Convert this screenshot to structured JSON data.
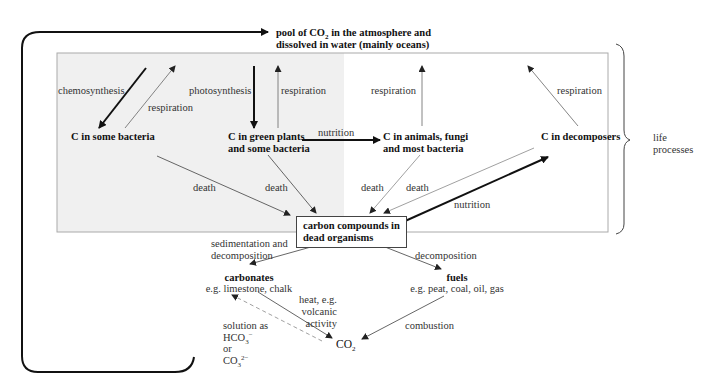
{
  "pool": {
    "line1": "pool of CO",
    "sub": "2",
    "line1_rest": " in the atmosphere and",
    "line2": "dissolved in water (mainly oceans)"
  },
  "nodes": {
    "some_bacteria": "C in some bacteria",
    "green_plants_1": "C in green plants",
    "green_plants_2": "and some bacteria",
    "animals_1": "C in animals, fungi",
    "animals_2": "and most bacteria",
    "decomposers": "C in decomposers",
    "dead_1": "carbon compounds in",
    "dead_2": "dead organisms",
    "carbonates_title": "carbonates",
    "carbonates_eg": "e.g. limestone, chalk",
    "fuels_title": "fuels",
    "fuels_eg": "e.g. peat, coal, oil, gas",
    "co2": "CO",
    "co2_sub": "2"
  },
  "labels": {
    "chemosynthesis": "chemosynthesis",
    "respiration_bacteria": "respiration",
    "photosynthesis": "photosynthesis",
    "respiration_plants": "respiration",
    "respiration_animals": "respiration",
    "respiration_decomposers": "respiration",
    "nutrition_plants_animals": "nutrition",
    "death_bacteria": "death",
    "death_plants": "death",
    "death_animals": "death",
    "death_decomposers": "death",
    "nutrition_decomposers": "nutrition",
    "sedimentation_1": "sedimentation and",
    "sedimentation_2": "decomposition",
    "decomposition": "decomposition",
    "heat_1": "heat, e.g.",
    "heat_2": "volcanic",
    "heat_3": "activity",
    "combustion": "combustion",
    "solution_1": "solution as",
    "solution_hco3": "HCO",
    "solution_hco3_sub": "3",
    "solution_hco3_sup": "−",
    "solution_or": "or",
    "solution_co3": "CO",
    "solution_co3_sub": "3",
    "solution_co3_sup": "2−",
    "life_1": "life",
    "life_2": "processes"
  },
  "colors": {
    "shaded_region": "#f0f0f0",
    "box_border": "#999999",
    "thick_arrow": "#111111",
    "thin_arrow": "#555555"
  }
}
